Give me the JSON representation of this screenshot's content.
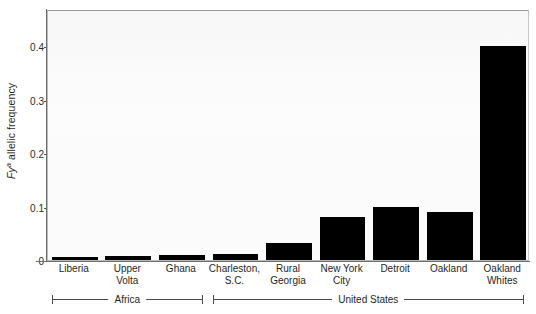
{
  "chart_data": {
    "type": "bar",
    "title": "",
    "subtitle": "",
    "xlabel": "",
    "ylabel": "Fy a allelic frequency",
    "ylabel_parts": {
      "italic_gene": "Fy",
      "superscript": "a",
      "rest": " allelic frequency"
    },
    "categories": [
      "Liberia",
      "Upper Volta",
      "Ghana",
      "Charleston, S.C.",
      "Rural Georgia",
      "New York City",
      "Detroit",
      "Oakland",
      "Oakland Whites"
    ],
    "category_lines": [
      [
        "Liberia",
        ""
      ],
      [
        "Upper",
        "Volta"
      ],
      [
        "Ghana",
        ""
      ],
      [
        "Charleston,",
        "S.C."
      ],
      [
        "Rural",
        "Georgia"
      ],
      [
        "New York",
        "City"
      ],
      [
        "Detroit",
        ""
      ],
      [
        "Oakland",
        ""
      ],
      [
        "Oakland",
        "Whites"
      ]
    ],
    "values": [
      0.005,
      0.008,
      0.009,
      0.012,
      0.032,
      0.081,
      0.1,
      0.089,
      0.4
    ],
    "ylim": [
      0,
      0.47
    ],
    "yticks": [
      0,
      0.1,
      0.2,
      0.3,
      0.4
    ],
    "ytick_labels": [
      "0",
      "0.1",
      "0.2",
      "0.3",
      "0.4"
    ],
    "grid": false,
    "legend": null,
    "bar_color": "#000000",
    "groups": [
      {
        "label": "Africa",
        "start_index": 0,
        "end_index": 2
      },
      {
        "label": "United States",
        "start_index": 3,
        "end_index": 8
      }
    ]
  },
  "colors": {
    "bar": "#000000",
    "axis": "#6e6e6e",
    "text": "#1f1f1f",
    "plot_background": "#fafafa",
    "frame": "#b9b9b9"
  }
}
